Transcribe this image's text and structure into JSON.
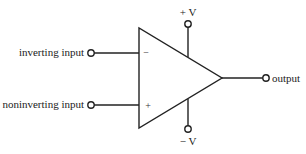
{
  "diagram": {
    "labels": {
      "inverting_input": "inverting input",
      "noninverting_input": "noninverting input",
      "output": "output",
      "positive_supply": "+ V",
      "negative_supply": "− V",
      "minus_sign": "−",
      "plus_sign": "+"
    },
    "colors": {
      "stroke": "#222222",
      "background": "#ffffff"
    }
  }
}
